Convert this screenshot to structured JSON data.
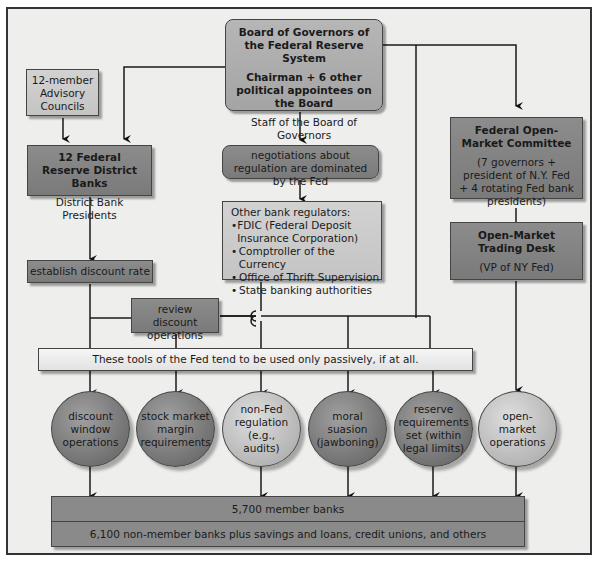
{
  "board": {
    "title": "Board of Governors of the Federal Reserve System",
    "members": "Chairman + 6 other political appointees on the Board",
    "staff": "Staff of the Board of Governors"
  },
  "advisory": {
    "label": "12-member Advisory Councils"
  },
  "district_banks": {
    "title": "12 Federal Reserve District Banks",
    "subtitle": "District Bank Presidents"
  },
  "negotiations": {
    "label": "negotiations about regulation are dominated by the Fed"
  },
  "other_regulators": {
    "title": "Other bank regulators:",
    "items": [
      "FDIC (Federal Deposit Insurance Corporation)",
      "Comptroller of the Currency",
      "Office of Thrift Supervision",
      "State banking authorities"
    ]
  },
  "fomc": {
    "title": "Federal Open-Market Committee",
    "subtitle": "(7 governors + president of N.Y. Fed + 4 rotating Fed bank presidents)"
  },
  "trading_desk": {
    "title": "Open-Market Trading Desk",
    "subtitle": "(VP of NY Fed)"
  },
  "discount_rate": {
    "label": "establish discount rate"
  },
  "review_discount": {
    "label": "review discount operations"
  },
  "passive_note": {
    "label": "These tools of the Fed tend to be used only passively, if at all."
  },
  "tools": [
    {
      "label": "discount window operations",
      "shade": "dark"
    },
    {
      "label": "stock market margin requirements",
      "shade": "dark"
    },
    {
      "label": "non-Fed regulation (e.g., audits)",
      "shade": "light"
    },
    {
      "label": "moral suasion (jawboning)",
      "shade": "dark"
    },
    {
      "label": "reserve requirements set (within legal limits)",
      "shade": "dark"
    },
    {
      "label": "open-market operations",
      "shade": "light"
    }
  ],
  "banks": {
    "member": "5,700 member banks",
    "non_member": "6,100 non-member banks plus savings and loans, credit unions, and others"
  },
  "colors": {
    "dark_box": "#808080",
    "mid_box": "#aaaaaa",
    "light_box": "#c8c8c8",
    "background": "#eeeeec",
    "line": "#1a1a1a"
  }
}
